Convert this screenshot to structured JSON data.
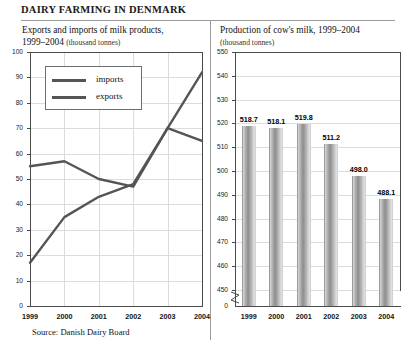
{
  "header": {
    "title": "DAIRY FARMING IN DENMARK"
  },
  "source": {
    "note": "Source: Danish Dairy Board"
  },
  "left_panel": {
    "title": "Exports and imports of milk products,",
    "title_line2": "1999–2004",
    "units": "(thousand tonnes)",
    "legend": {
      "imports_label": "imports",
      "exports_label": "exports"
    }
  },
  "right_panel": {
    "title": "Production of cow's milk, 1999–2004",
    "units": "(thousand tonnes)"
  },
  "chart_data": [
    {
      "type": "line",
      "title": "Exports and imports of milk products, 1999–2004 (thousand tonnes)",
      "xlabel": "",
      "ylabel": "thousand tonnes",
      "categories": [
        "1999",
        "2000",
        "2001",
        "2002",
        "2003",
        "2004"
      ],
      "ylim": [
        0,
        100
      ],
      "yticks": [
        0,
        10,
        20,
        30,
        40,
        50,
        60,
        70,
        80,
        90,
        100
      ],
      "grid": true,
      "legend_position": "top-left",
      "series": [
        {
          "name": "imports",
          "values": [
            17,
            35,
            43,
            48,
            70,
            92
          ],
          "color": "#555555"
        },
        {
          "name": "exports",
          "values": [
            55,
            57,
            50,
            47,
            70,
            65
          ],
          "color": "#555555"
        }
      ]
    },
    {
      "type": "bar",
      "title": "Production of cow's milk, 1999–2004 (thousand tonnes)",
      "xlabel": "",
      "ylabel": "thousand tonnes",
      "categories": [
        "1999",
        "2000",
        "2001",
        "2002",
        "2003",
        "2004"
      ],
      "values": [
        518.7,
        518.1,
        519.8,
        511.2,
        498.0,
        488.1
      ],
      "data_labels": [
        "518.7",
        "518.1",
        "519.8",
        "511.2",
        "498.0",
        "488.1"
      ],
      "ylim": [
        450,
        550
      ],
      "yticks": [
        450,
        460,
        470,
        480,
        490,
        500,
        510,
        520,
        530,
        540,
        550
      ],
      "axis_break": true,
      "axis_break_label": "0",
      "grid": true,
      "bar_color": "#a0a0a0"
    }
  ]
}
